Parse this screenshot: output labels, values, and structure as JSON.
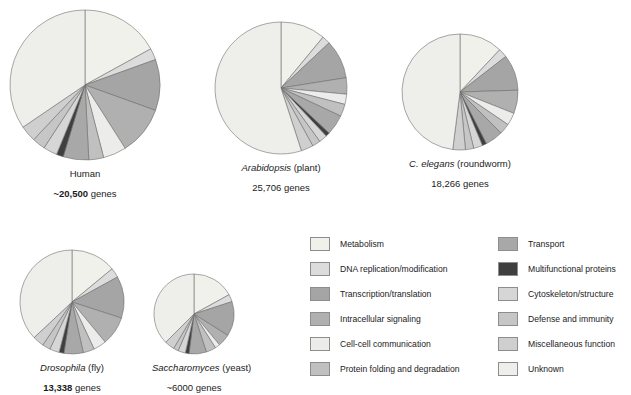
{
  "chart_data": {
    "type": "pie",
    "title": "",
    "categories": [
      "Metabolism",
      "DNA replication/modification",
      "Transcription/translation",
      "Intracellular signaling",
      "Cell-cell communication",
      "Protein folding and degradation",
      "Transport",
      "Multifunctional proteins",
      "Cytoskeleton/structure",
      "Defense and immunity",
      "Miscellaneous function",
      "Unknown"
    ],
    "colors": [
      "#f1f1ec",
      "#dcdcdc",
      "#a5a5a5",
      "#b0b0b0",
      "#ececea",
      "#c0c0c0",
      "#a8a8a8",
      "#3f3f3f",
      "#d6d6d6",
      "#c6c6c6",
      "#cfcfcf",
      "#eeeeea"
    ],
    "legend_position": "bottom-right",
    "grid": false,
    "series": [
      {
        "name": "Human",
        "values": [
          17.0,
          2.5,
          11.0,
          10.5,
          5.0,
          3.2,
          5.5,
          1.5,
          3.0,
          2.8,
          3.5,
          34.5
        ]
      },
      {
        "name": "Arabidopsis",
        "values": [
          11.0,
          2.0,
          9.5,
          4.0,
          2.5,
          3.0,
          5.0,
          1.0,
          2.0,
          2.0,
          3.0,
          55.0
        ]
      },
      {
        "name": "C. elegans",
        "values": [
          12.0,
          2.5,
          10.0,
          6.5,
          3.5,
          3.0,
          5.0,
          1.2,
          2.5,
          2.3,
          3.5,
          48.0
        ]
      },
      {
        "name": "Drosophila",
        "values": [
          14.0,
          3.0,
          13.0,
          9.0,
          4.0,
          3.5,
          6.0,
          1.5,
          3.0,
          2.5,
          3.5,
          37.0
        ]
      },
      {
        "name": "Saccharomyces",
        "values": [
          17.0,
          3.0,
          14.0,
          5.0,
          2.0,
          4.0,
          7.0,
          1.5,
          3.0,
          2.0,
          4.0,
          37.5
        ]
      }
    ]
  },
  "panels": [
    {
      "id": "human",
      "species_prefix": "",
      "genus": "Human",
      "species_suffix": "",
      "gene_number": "~20,500",
      "gene_word": "genes",
      "radius": 75
    },
    {
      "id": "arabidopsis",
      "species_prefix": "",
      "genus": "Arabidopsis",
      "species_suffix": " (plant)",
      "gene_number": "25,706",
      "gene_word": "genes",
      "radius": 66
    },
    {
      "id": "celegans",
      "species_prefix": "",
      "genus": "C. elegans",
      "species_suffix": " (roundworm)",
      "gene_number": "18,266",
      "gene_word": "genes",
      "radius": 58
    },
    {
      "id": "drosophila",
      "species_prefix": "",
      "genus": "Drosophila",
      "species_suffix": " (fly)",
      "gene_number": "13,338",
      "gene_word": "genes",
      "radius": 52
    },
    {
      "id": "saccharomyces",
      "species_prefix": "",
      "genus": "Saccharomyces",
      "species_suffix": " (yeast)",
      "gene_number": "~6000",
      "gene_word": "genes",
      "radius": 40
    }
  ],
  "legend": {
    "left_column": [
      {
        "label": "Metabolism",
        "color": "#f1f1ec"
      },
      {
        "label": "DNA replication/modification",
        "color": "#dcdcdc"
      },
      {
        "label": "Transcription/translation",
        "color": "#a5a5a5"
      },
      {
        "label": "Intracellular signaling",
        "color": "#b0b0b0"
      },
      {
        "label": "Cell-cell communication",
        "color": "#ececea"
      },
      {
        "label": "Protein folding and degradation",
        "color": "#c0c0c0"
      }
    ],
    "right_column": [
      {
        "label": "Transport",
        "color": "#a8a8a8"
      },
      {
        "label": "Multifunctional proteins",
        "color": "#3f3f3f"
      },
      {
        "label": "Cytoskeleton/structure",
        "color": "#d6d6d6"
      },
      {
        "label": "Defense and immunity",
        "color": "#c6c6c6"
      },
      {
        "label": "Miscellaneous function",
        "color": "#cfcfcf"
      },
      {
        "label": "Unknown",
        "color": "#eeeeea"
      }
    ]
  },
  "layout": {
    "panel_positions": [
      {
        "left": 8,
        "top": 8
      },
      {
        "left": 213,
        "top": 20
      },
      {
        "left": 400,
        "top": 32
      },
      {
        "left": 18,
        "top": 248
      },
      {
        "left": 152,
        "top": 272
      }
    ]
  }
}
